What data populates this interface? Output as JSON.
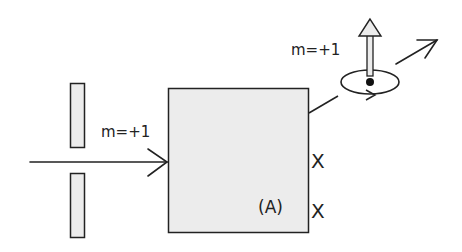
{
  "diagram": {
    "incoming_label": "m=+1",
    "outgoing_label": "m=+1",
    "box_label": "(A)",
    "marks": [
      "X",
      "X"
    ],
    "colors": {
      "stroke": "#222222",
      "fill": "#ececec",
      "background": "#ffffff"
    }
  }
}
